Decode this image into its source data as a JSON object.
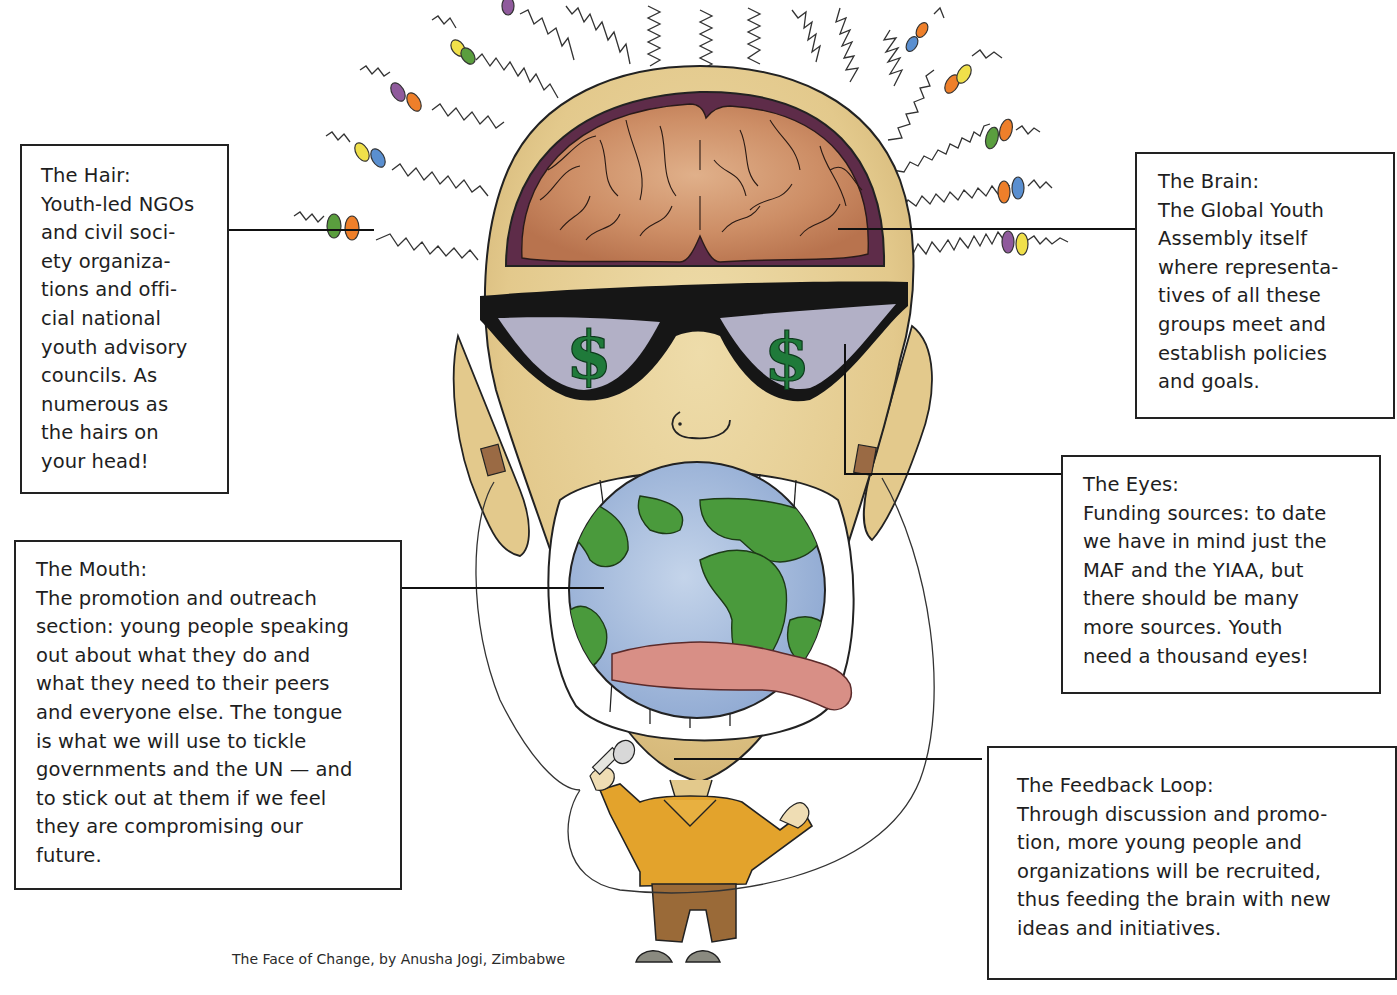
{
  "caption": "The Face of Change, by Anusha Jogi, Zimbabwe",
  "callouts": {
    "hair": {
      "title": "The Hair:",
      "lines": [
        "Youth-led NGOs",
        "and civil soci-",
        "ety organiza-",
        "tions and offi-",
        "cial national",
        "youth advisory",
        "councils. As",
        "numerous as",
        "the hairs on",
        "your head!"
      ]
    },
    "brain": {
      "title": "The Brain:",
      "lines": [
        "The Global Youth",
        "Assembly itself",
        "where representa-",
        "tives of all these",
        "groups meet and",
        "establish policies",
        "and goals."
      ]
    },
    "eyes": {
      "title": "The Eyes:",
      "lines": [
        "Funding sources: to date",
        "we have in mind just the",
        "MAF and the YIAA, but",
        "there should be many",
        "more sources. Youth",
        "need a thousand eyes!"
      ]
    },
    "mouth": {
      "title": "The Mouth:",
      "lines": [
        "The promotion and outreach",
        "section: young people speaking",
        "out about what they do and",
        "what they need to their peers",
        "and everyone else. The tongue",
        "is what we will use to tickle",
        "governments and the UN — and",
        "to stick out at them if we feel",
        "they are compromising our",
        "future."
      ]
    },
    "feedback": {
      "title": "The Feedback Loop:",
      "lines": [
        "Through discussion and promo-",
        "tion, more young people and",
        "organizations will be recruited,",
        "thus feeding the brain with new",
        "ideas and initiatives."
      ]
    }
  },
  "illustration": {
    "subject": "cartoon head with exposed brain, dollar-sign sunglasses, globe mouth with tongue, small suited figure holding microphone",
    "icons": [
      "brain-icon",
      "dollar-sign-icon",
      "globe-icon",
      "tongue-icon",
      "microphone-icon",
      "beaded-hair-icon"
    ],
    "colors": {
      "skin": "#e8d29a",
      "skin_shadow": "#cdb06e",
      "brain": "#c98a62",
      "brain_dark": "#5e2c49",
      "glasses_frame": "#161616",
      "lens": "#b2b0c6",
      "dollar": "#1f7a3a",
      "ocean": "#a9bfdc",
      "land": "#4a9a3c",
      "tongue": "#d88f86",
      "jacket": "#e3a32c",
      "pants": "#9a6a38",
      "shoes": "#8a8a80",
      "bead_colors": [
        "#8f5a9c",
        "#ee7f2a",
        "#f0e04a",
        "#5a9e3e",
        "#5a8fd0"
      ]
    }
  }
}
